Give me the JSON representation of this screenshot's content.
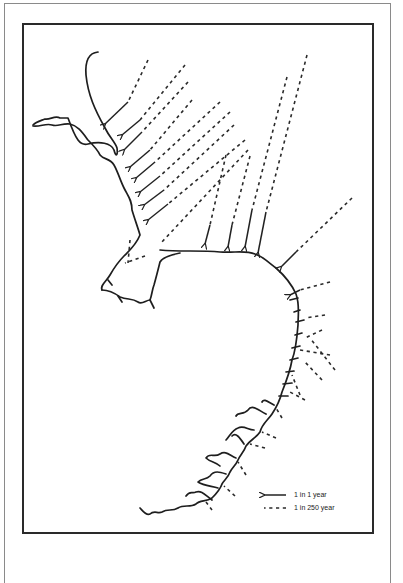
{
  "figure": {
    "type": "map",
    "colors": {
      "ink": "#1e1e1e",
      "frame_outer": "#8a8a8a",
      "frame_inner": "#2a2a2a",
      "background": "#ffffff"
    }
  },
  "legend": {
    "items": [
      {
        "symbol": "solid-arrow",
        "label": "1 in 1 year"
      },
      {
        "symbol": "dashed-arrow",
        "label": "1 in 250 year"
      }
    ]
  }
}
